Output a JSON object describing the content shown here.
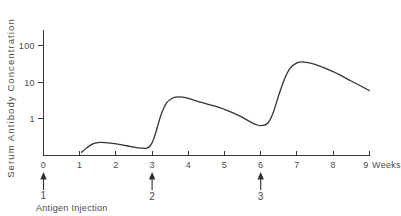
{
  "chart_data": {
    "type": "line",
    "title": "",
    "xlabel": "Weeks",
    "ylabel": "Serum  Antibody  Concentration",
    "yscale": "log",
    "ylim": [
      0.08,
      300
    ],
    "xlim": [
      0,
      9
    ],
    "grid": false,
    "legend": null,
    "y_ticks": [
      {
        "value": 1,
        "label": "1"
      },
      {
        "value": 10,
        "label": "10"
      },
      {
        "value": 100,
        "label": "100"
      }
    ],
    "x_ticks": [
      {
        "value": 0,
        "label": "0"
      },
      {
        "value": 1,
        "label": "1"
      },
      {
        "value": 2,
        "label": "2"
      },
      {
        "value": 3,
        "label": "3"
      },
      {
        "value": 4,
        "label": "4"
      },
      {
        "value": 5,
        "label": "5"
      },
      {
        "value": 6,
        "label": "6"
      },
      {
        "value": 7,
        "label": "7"
      },
      {
        "value": 8,
        "label": "8"
      },
      {
        "value": 9,
        "label": "9"
      }
    ],
    "x_axis_units": "Weeks",
    "series": [
      {
        "name": "Serum antibody concentration",
        "x": [
          1.05,
          1.2,
          1.35,
          1.5,
          1.7,
          1.9,
          2.1,
          2.3,
          2.5,
          2.7,
          2.85,
          2.95,
          3.05,
          3.15,
          3.25,
          3.4,
          3.55,
          3.7,
          3.85,
          4.0,
          4.3,
          4.6,
          5.0,
          5.4,
          5.7,
          5.9,
          6.05,
          6.2,
          6.35,
          6.5,
          6.65,
          6.8,
          7.0,
          7.2,
          7.5,
          8.0,
          8.5,
          9.0
        ],
        "y": [
          0.115,
          0.155,
          0.195,
          0.215,
          0.215,
          0.205,
          0.19,
          0.175,
          0.16,
          0.15,
          0.15,
          0.175,
          0.28,
          0.6,
          1.3,
          2.7,
          3.6,
          4.0,
          3.9,
          3.6,
          2.9,
          2.4,
          1.8,
          1.2,
          0.82,
          0.66,
          0.64,
          0.75,
          1.5,
          4.5,
          12.0,
          24.0,
          35.0,
          37.0,
          32.0,
          20.0,
          11.0,
          6.0
        ]
      }
    ],
    "annotations": [
      {
        "id": "1",
        "x": 0,
        "label": "1",
        "caption": "Antigen Injection",
        "marker": "up-arrow"
      },
      {
        "id": "2",
        "x": 3,
        "label": "2",
        "caption": "",
        "marker": "up-arrow"
      },
      {
        "id": "3",
        "x": 6,
        "label": "3",
        "caption": "",
        "marker": "up-arrow"
      }
    ],
    "caption": "Antigen Injection"
  },
  "colors": {
    "curve": "#333333",
    "axis": "#3a3a3a",
    "text": "#4a4a4a",
    "background": "#ffffff"
  }
}
